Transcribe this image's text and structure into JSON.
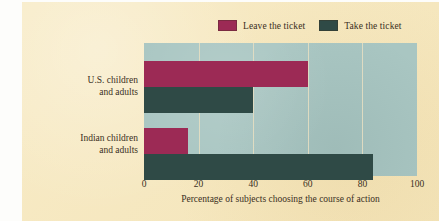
{
  "figure": {
    "background_color": "#f7e9c0",
    "plot_background_color": "#a9c6c2",
    "gridline_color": "#e8dfc2"
  },
  "legend": {
    "position": "top",
    "entries": [
      {
        "label": "Leave the ticket",
        "color": "#9c2a55",
        "swatch_name": "legend-swatch-leave"
      },
      {
        "label": "Take the ticket",
        "color": "#2f4a46",
        "swatch_name": "legend-swatch-take"
      }
    ]
  },
  "axis": {
    "x_title": "Percentage of subjects choosing the course of action",
    "ticks": [
      "0",
      "20",
      "40",
      "60",
      "80",
      "100"
    ]
  },
  "categories": [
    {
      "line1": "U.S. children",
      "line2": "and adults"
    },
    {
      "line1": "Indian children",
      "line2": "and adults"
    }
  ],
  "chart_data": {
    "type": "bar",
    "orientation": "horizontal",
    "title": "",
    "subtitle": "",
    "xlabel": "Percentage of subjects choosing the course of action",
    "ylabel": "",
    "categories": [
      "U.S. children and adults",
      "Indian children and adults"
    ],
    "series": [
      {
        "name": "Leave the ticket",
        "color": "#9c2a55",
        "values": [
          60,
          16
        ]
      },
      {
        "name": "Take the ticket",
        "color": "#2f4a46",
        "values": [
          40,
          84
        ]
      }
    ],
    "xlim": [
      0,
      100
    ],
    "xticks": [
      0,
      20,
      40,
      60,
      80,
      100
    ],
    "grid": true,
    "grid_axis": "x",
    "legend_position": "top"
  }
}
